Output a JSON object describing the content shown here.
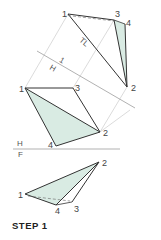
{
  "caption": "STEP 1",
  "colors": {
    "fill": "#d9ebe3",
    "edge": "#333333",
    "projector": "#cfcfcf",
    "fold": "#a8a8a8"
  },
  "views": {
    "auxiliary": {
      "points": {
        "1": [
          68,
          14
        ],
        "2": [
          127,
          87
        ],
        "3": [
          114,
          20
        ],
        "4": [
          125,
          24
        ]
      },
      "labels": {
        "p1": "1",
        "p2": "2",
        "p3": "3",
        "p4": "4"
      },
      "annotation": "TL"
    },
    "top": {
      "points": {
        "1": [
          25,
          88
        ],
        "2": [
          100,
          132
        ],
        "3": [
          73,
          88
        ],
        "4": [
          56,
          146
        ]
      },
      "labels": {
        "p1": "1",
        "p2": "2",
        "p3": "3",
        "p4": "4"
      }
    },
    "front": {
      "points": {
        "1": [
          25,
          194
        ],
        "2": [
          99,
          162
        ],
        "3": [
          72,
          202
        ],
        "4": [
          56,
          205
        ]
      },
      "labels": {
        "p1": "1",
        "p2": "2",
        "p3": "3",
        "p4": "4"
      }
    }
  },
  "fold_lines": {
    "h_1": {
      "upper": "1",
      "lower": "H"
    },
    "h_f": {
      "upper": "H",
      "lower": "F"
    }
  }
}
